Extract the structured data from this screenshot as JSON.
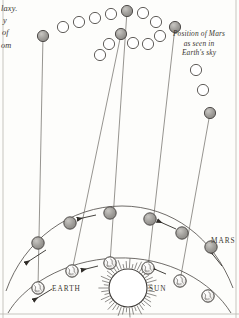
{
  "figure": {
    "kind": "retrograde-motion-diagram",
    "left_caption_fragments": [
      "laxy.",
      "y",
      "of",
      "om"
    ],
    "sky_note": [
      "Position of Mars",
      "as seen in",
      "Earth's sky"
    ],
    "labels": {
      "earth": "Earth",
      "sun": "Sun",
      "mars": "Mars"
    },
    "colors": {
      "ink": "#3a3630",
      "mars_sphere": "#9c9a96",
      "mars_sphere_edge": "#4a4744",
      "open_circle_edge": "#4f4c48",
      "sightline": "#6e6b66",
      "orbit": "#55524e",
      "paper": "#fdfdfb"
    },
    "sky_positions": [
      {
        "x": 63,
        "y": 27,
        "filled": false
      },
      {
        "x": 79,
        "y": 22,
        "filled": false
      },
      {
        "x": 95,
        "y": 18,
        "filled": false
      },
      {
        "x": 111,
        "y": 14,
        "filled": false
      },
      {
        "x": 127,
        "y": 11,
        "filled": true
      },
      {
        "x": 143,
        "y": 13,
        "filled": false
      },
      {
        "x": 156,
        "y": 22,
        "filled": false
      },
      {
        "x": 160,
        "y": 36,
        "filled": false
      },
      {
        "x": 148,
        "y": 44,
        "filled": false
      },
      {
        "x": 133,
        "y": 43,
        "filled": false
      },
      {
        "x": 121,
        "y": 34,
        "filled": true
      },
      {
        "x": 109,
        "y": 44,
        "filled": false
      },
      {
        "x": 100,
        "y": 55,
        "filled": false
      },
      {
        "x": 175,
        "y": 27,
        "filled": true
      },
      {
        "x": 196,
        "y": 70,
        "filled": false
      },
      {
        "x": 203,
        "y": 90,
        "filled": false
      },
      {
        "x": 210,
        "y": 113,
        "filled": true
      },
      {
        "x": 43,
        "y": 36,
        "filled": true
      }
    ],
    "mars_orbit_bodies": [
      {
        "x": 38,
        "y": 243
      },
      {
        "x": 70,
        "y": 223
      },
      {
        "x": 110,
        "y": 213
      },
      {
        "x": 150,
        "y": 219
      },
      {
        "x": 182,
        "y": 233
      },
      {
        "x": 211,
        "y": 247
      }
    ],
    "earth_orbit_bodies": [
      {
        "x": 38,
        "y": 288
      },
      {
        "x": 72,
        "y": 271
      },
      {
        "x": 110,
        "y": 263
      },
      {
        "x": 148,
        "y": 268
      },
      {
        "x": 180,
        "y": 281
      },
      {
        "x": 208,
        "y": 296
      }
    ],
    "sightlines": [
      {
        "x1": 38,
        "y1": 288,
        "x2": 43,
        "y2": 36
      },
      {
        "x1": 72,
        "y1": 271,
        "x2": 121,
        "y2": 34
      },
      {
        "x1": 110,
        "y1": 263,
        "x2": 127,
        "y2": 11
      },
      {
        "x1": 148,
        "y1": 268,
        "x2": 175,
        "y2": 27
      },
      {
        "x1": 180,
        "y1": 281,
        "x2": 210,
        "y2": 113
      }
    ],
    "sun": {
      "x": 128,
      "y": 288,
      "r": 19,
      "ray_count": 46
    }
  }
}
